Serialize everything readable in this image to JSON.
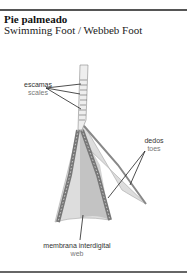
{
  "header": {
    "title": "Pie palmeado",
    "subtitle": "Swimming Foot / Webbeb Foot"
  },
  "labels": [
    {
      "es": "escamas",
      "en": "scales"
    },
    {
      "es": "dedos",
      "en": "toes"
    },
    {
      "es": "membrana interdigital",
      "en": "web"
    }
  ]
}
